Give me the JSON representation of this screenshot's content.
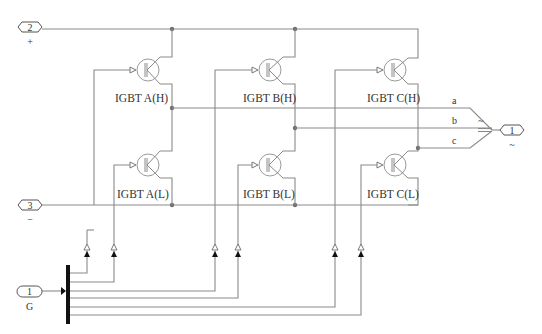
{
  "diagram": {
    "type": "Simulink three-phase IGBT inverter bridge subsystem",
    "ports": {
      "dc_plus": {
        "number": "2",
        "sign": "+"
      },
      "dc_minus": {
        "number": "3",
        "sign": "−"
      },
      "ac_out": {
        "number": "1",
        "sign": "~"
      },
      "gate": {
        "number": "1",
        "sign": "G"
      }
    },
    "switches": [
      {
        "id": "AH",
        "label": "IGBT A(H)"
      },
      {
        "id": "AL",
        "label": "IGBT A(L)"
      },
      {
        "id": "BH",
        "label": "IGBT B(H)"
      },
      {
        "id": "BL",
        "label": "IGBT B(L)"
      },
      {
        "id": "CH",
        "label": "IGBT C(H)"
      },
      {
        "id": "CL",
        "label": "IGBT C(L)"
      }
    ],
    "mux": {
      "phase_labels": [
        "a",
        "b",
        "c"
      ],
      "output_symbol": "~"
    },
    "colors": {
      "wire": "#8a8a8a",
      "junction": "#707070",
      "bus_bar": "#111111",
      "text": "#333333"
    }
  }
}
